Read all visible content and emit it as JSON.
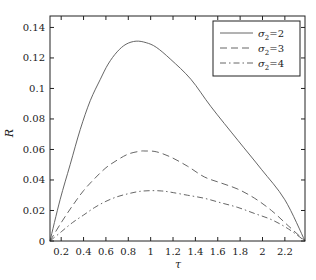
{
  "chart_data": {
    "type": "line",
    "title": "",
    "xlabel": "τ",
    "ylabel": "R",
    "xlim": [
      0.1,
      2.38
    ],
    "ylim": [
      0,
      0.1475
    ],
    "grid": false,
    "legend_position": "upper right",
    "x_ticks": [
      0.2,
      0.4,
      0.6,
      0.8,
      1,
      1.2,
      1.4,
      1.6,
      1.8,
      2,
      2.2
    ],
    "x_tick_labels": [
      "0.2",
      "0.4",
      "0.6",
      "0.8",
      "1",
      "1.2",
      "1.4",
      "1.6",
      "1.8",
      "2",
      "2.2"
    ],
    "y_ticks": [
      0,
      0.02,
      0.04,
      0.06,
      0.08,
      0.1,
      0.12,
      0.14
    ],
    "y_tick_labels": [
      "0",
      "0.02",
      "0.04",
      "0.06",
      "0.08",
      "0.1",
      "0.12",
      "0.14"
    ],
    "series": [
      {
        "name": "σ2=2",
        "label_base": "σ",
        "label_sub": "2",
        "label_rest": "=2",
        "style": "solid",
        "x": [
          0.1,
          0.19,
          0.28,
          0.37,
          0.46,
          0.55,
          0.62,
          0.7,
          0.78,
          0.87,
          0.96,
          1.05,
          1.18,
          1.36,
          1.54,
          1.78,
          1.99,
          2.2,
          2.38
        ],
        "y": [
          0,
          0.027,
          0.05,
          0.073,
          0.092,
          0.106,
          0.116,
          0.124,
          0.129,
          0.131,
          0.13,
          0.127,
          0.119,
          0.106,
          0.088,
          0.066,
          0.047,
          0.027,
          0
        ]
      },
      {
        "name": "σ2=3",
        "label_base": "σ",
        "label_sub": "2",
        "label_rest": "=3",
        "style": "dashed",
        "x": [
          0.1,
          0.2,
          0.3,
          0.4,
          0.5,
          0.6,
          0.7,
          0.8,
          0.9,
          0.95,
          1.05,
          1.18,
          1.33,
          1.48,
          1.63,
          1.78,
          1.93,
          2.08,
          2.23,
          2.38
        ],
        "y": [
          0,
          0.012,
          0.023,
          0.033,
          0.041,
          0.048,
          0.053,
          0.057,
          0.0588,
          0.059,
          0.0585,
          0.055,
          0.049,
          0.042,
          0.038,
          0.034,
          0.028,
          0.02,
          0.01,
          0
        ]
      },
      {
        "name": "σ2=4",
        "label_base": "σ",
        "label_sub": "2",
        "label_rest": "=4",
        "style": "dashdot",
        "x": [
          0.1,
          0.2,
          0.3,
          0.4,
          0.5,
          0.6,
          0.7,
          0.8,
          0.9,
          1.0,
          1.1,
          1.18,
          1.33,
          1.48,
          1.63,
          1.78,
          1.93,
          2.08,
          2.23,
          2.38
        ],
        "y": [
          0,
          0.006,
          0.012,
          0.017,
          0.022,
          0.026,
          0.029,
          0.031,
          0.0325,
          0.033,
          0.0328,
          0.032,
          0.03,
          0.028,
          0.025,
          0.022,
          0.018,
          0.014,
          0.008,
          0
        ]
      }
    ]
  },
  "legend": {
    "items": [
      {
        "symbol": "σ",
        "sub": "2",
        "rest": "=2"
      },
      {
        "symbol": "σ",
        "sub": "2",
        "rest": "=3"
      },
      {
        "symbol": "σ",
        "sub": "2",
        "rest": "=4"
      }
    ]
  },
  "axes": {
    "x_label": "τ",
    "y_label": "R"
  },
  "style": {
    "line_color": "#555555",
    "axis_color": "#222222",
    "background": "#ffffff"
  }
}
